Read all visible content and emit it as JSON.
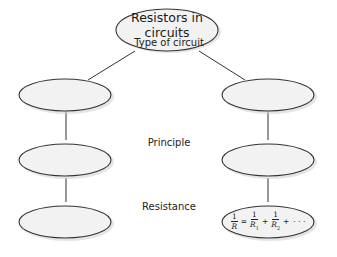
{
  "root": {
    "line1": "Resistors in",
    "line2": "circuits"
  },
  "rows": [
    {
      "label": "Type of circuit"
    },
    {
      "label": "Principle"
    },
    {
      "label": "Resistance"
    }
  ],
  "left_nodes": [
    "",
    "",
    ""
  ],
  "right_nodes": [
    "",
    "",
    "formula"
  ],
  "formula": {
    "lhs_num": "1",
    "lhs_den": "R",
    "equals": "=",
    "t1_num": "1",
    "t1_den": "R",
    "t1_sub": "1",
    "plus1": "+",
    "t2_num": "1",
    "t2_den": "R",
    "t2_sub": "2",
    "plus2": "+",
    "ellipsis": "· · ·"
  },
  "colors": {
    "node_fill": "#f2f2f2",
    "stroke": "#333333",
    "shadow": "#cfcfcf"
  }
}
